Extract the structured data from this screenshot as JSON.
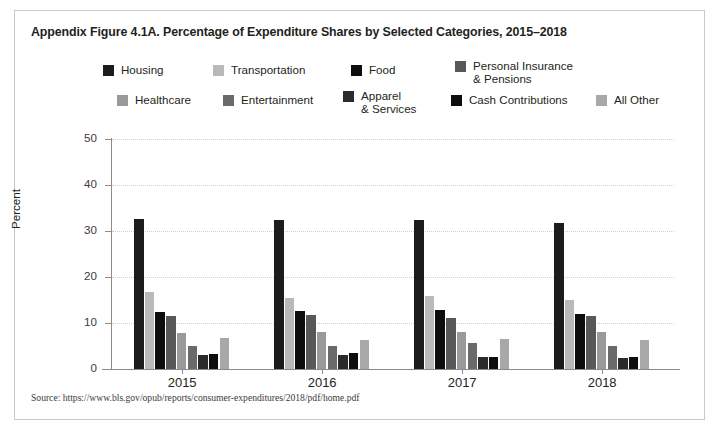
{
  "figure": {
    "title": "Appendix Figure 4.1A. Percentage of Expenditure Shares by Selected Categories, 2015–2018",
    "source": "Source: https://www.bls.gov/opub/reports/consumer-expenditures/2018/pdf/home.pdf"
  },
  "legend": {
    "items": [
      {
        "label": "Housing",
        "color": "#1c1c1c"
      },
      {
        "label": "Transportation",
        "color": "#b9b9b9"
      },
      {
        "label": "Food",
        "color": "#0d0d0d"
      },
      {
        "label": "Personal Insurance\n& Pensions",
        "color": "#585858"
      },
      {
        "label": "Healthcare",
        "color": "#9a9a9a"
      },
      {
        "label": "Entertainment",
        "color": "#6a6a6a"
      },
      {
        "label": "Apparel\n& Services",
        "color": "#2b2b2b"
      },
      {
        "label": "Cash Contributions",
        "color": "#0d0d0d"
      },
      {
        "label": "All Other",
        "color": "#a8a8a8"
      }
    ]
  },
  "chart_data": {
    "type": "bar",
    "title": "Appendix Figure 4.1A. Percentage of Expenditure Shares by Selected Categories, 2015–2018",
    "xlabel": "",
    "ylabel": "Percent",
    "ylim": [
      0,
      50
    ],
    "yticks": [
      0,
      10,
      20,
      30,
      40,
      50
    ],
    "ytick_labels": [
      "0",
      "10",
      "20",
      "30",
      "40",
      "50"
    ],
    "grid": true,
    "legend_position": "top",
    "categories": [
      "2015",
      "2016",
      "2017",
      "2018"
    ],
    "series": [
      {
        "name": "Housing",
        "color": "#1c1c1c",
        "values": [
          32.7,
          32.4,
          32.4,
          31.8
        ]
      },
      {
        "name": "Transportation",
        "color": "#b9b9b9",
        "values": [
          16.8,
          15.4,
          15.9,
          15.1
        ]
      },
      {
        "name": "Food",
        "color": "#0d0d0d",
        "values": [
          12.5,
          12.6,
          12.9,
          12.0
        ]
      },
      {
        "name": "Personal Insurance & Pensions",
        "color": "#585858",
        "values": [
          11.6,
          11.7,
          11.1,
          11.5
        ]
      },
      {
        "name": "Healthcare",
        "color": "#9a9a9a",
        "values": [
          7.8,
          8.0,
          8.1,
          8.1
        ]
      },
      {
        "name": "Entertainment",
        "color": "#6a6a6a",
        "values": [
          5.1,
          5.1,
          5.6,
          4.9
        ]
      },
      {
        "name": "Apparel & Services",
        "color": "#2b2b2b",
        "values": [
          3.1,
          3.0,
          2.6,
          2.4
        ]
      },
      {
        "name": "Cash Contributions",
        "color": "#0d0d0d",
        "values": [
          3.2,
          3.4,
          2.7,
          2.6
        ]
      },
      {
        "name": "All Other",
        "color": "#a8a8a8",
        "values": [
          6.7,
          6.4,
          6.6,
          6.2
        ]
      }
    ]
  }
}
